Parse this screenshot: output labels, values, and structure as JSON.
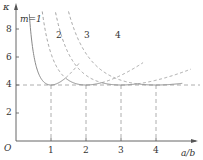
{
  "chart_data": {
    "type": "line",
    "title": "",
    "xlabel": "a/b",
    "ylabel": "κ",
    "origin_label": "O",
    "x_ticks": [
      "1",
      "2",
      "3",
      "4"
    ],
    "y_ticks": [
      "2",
      "4",
      "6",
      "8"
    ],
    "xlim": [
      0,
      5.1
    ],
    "ylim": [
      0,
      9.5
    ],
    "grid": false,
    "reference_line": {
      "y": 4,
      "style": "dashed"
    },
    "vertical_guides": [
      1,
      2,
      3,
      4
    ],
    "formula": "κ = (m·b/a + a/(m·b))²",
    "series": [
      {
        "name": "m=1",
        "label": "m=1",
        "m": 1,
        "minimum": {
          "x": 1,
          "y": 4
        }
      },
      {
        "name": "m=2",
        "label": "2",
        "m": 2,
        "minimum": {
          "x": 2,
          "y": 4
        }
      },
      {
        "name": "m=3",
        "label": "3",
        "m": 3,
        "minimum": {
          "x": 3,
          "y": 4
        }
      },
      {
        "name": "m=4",
        "label": "4",
        "m": 4,
        "minimum": {
          "x": 4,
          "y": 4
        }
      }
    ],
    "envelope_transitions": [
      1.414,
      2.449,
      3.464
    ],
    "colors": {
      "axis": "#555555",
      "curve": "#888888",
      "dash": "#999999"
    }
  }
}
